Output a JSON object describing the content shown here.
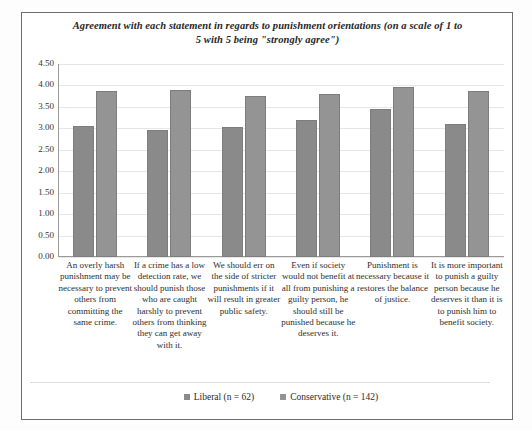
{
  "chart_data": {
    "type": "bar",
    "title": "Agreement with each statement in regards to punishment orientations (on a scale of 1 to 5 with 5 being \"strongly agree\")",
    "title_line_1": "Agreement with each statement in regards to punishment orientations (on a scale of 1 to",
    "title_line_2": "5 with 5 being \"strongly agree\")",
    "xlabel": "",
    "ylabel": "",
    "ylim": [
      0.0,
      4.5
    ],
    "ytick_labels": [
      "4.50",
      "4.00",
      "3.50",
      "3.00",
      "2.50",
      "2.00",
      "1.50",
      "1.00",
      "0.50",
      "0.00"
    ],
    "ytick_values": [
      4.5,
      4.0,
      3.5,
      3.0,
      2.5,
      2.0,
      1.5,
      1.0,
      0.5,
      0.0
    ],
    "grid": true,
    "legend_position": "bottom",
    "categories": [
      "An overly harsh punishment may be necessary to prevent others from committing the same crime.",
      "If a crime has a low detection rate, we should punish those who are caught harshly to prevent others from thinking they can get away with it.",
      "We should err on the side of stricter punishments if it will result in greater public safety.",
      "Even if society would not benefit at all from punishing a guilty person, he should still be punished because he deserves it.",
      "Punishment is necessary because it restores the balance of justice.",
      "It is more important to punish a guilty person because he deserves it than it is to punish him to benefit society."
    ],
    "series": [
      {
        "name": "Liberal (n = 62)",
        "color": "#8a8a8a",
        "values": [
          3.05,
          2.95,
          3.02,
          3.2,
          3.45,
          3.1
        ]
      },
      {
        "name": "Conservative (n = 142)",
        "color": "#949494",
        "values": [
          3.88,
          3.9,
          3.75,
          3.79,
          3.97,
          3.88
        ]
      }
    ]
  },
  "legend": {
    "items": [
      {
        "label": "Liberal (n = 62)"
      },
      {
        "label": "Conservative (n = 142)"
      }
    ]
  }
}
